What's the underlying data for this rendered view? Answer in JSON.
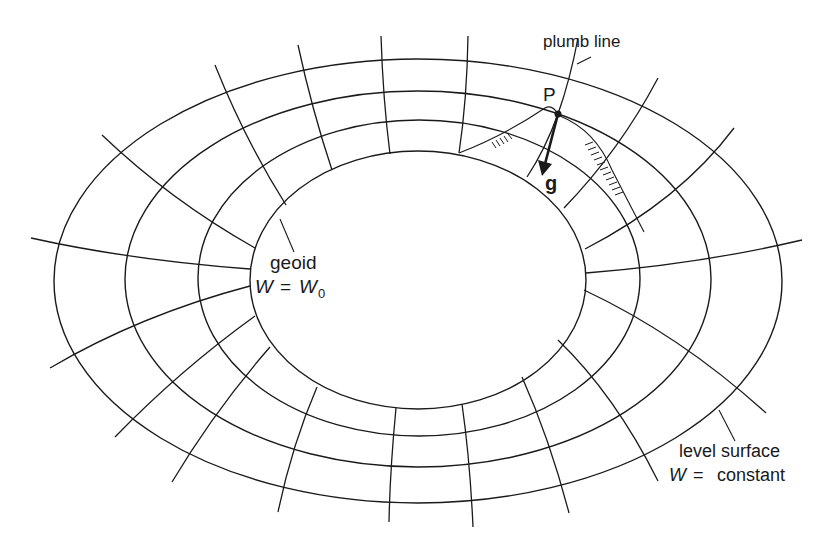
{
  "diagram": {
    "type": "geoid-level-surfaces",
    "colors": {
      "line": "#1a1a1a",
      "background": "#ffffff"
    },
    "labels": {
      "plumb_line": "plumb line",
      "point": "P",
      "gravity": "g",
      "geoid": "geoid",
      "geoid_eq_lhs": "W",
      "geoid_eq_op": "=",
      "geoid_eq_rhs": "W",
      "geoid_eq_sub": "0",
      "level_surface": "level surface",
      "level_eq_lhs": "W",
      "level_eq_op": "=",
      "level_eq_rhs": "constant"
    },
    "surfaces": [
      {
        "name": "geoid",
        "cx": 418,
        "cy": 280,
        "rx": 168,
        "ry": 129
      },
      {
        "name": "level-surface-1",
        "cx": 419,
        "cy": 278,
        "rx": 221,
        "ry": 158
      },
      {
        "name": "level-surface-2",
        "cx": 418,
        "cy": 279,
        "rx": 293,
        "ry": 188
      },
      {
        "name": "level-surface-3",
        "cx": 418,
        "cy": 281,
        "rx": 364,
        "ry": 222
      }
    ]
  }
}
